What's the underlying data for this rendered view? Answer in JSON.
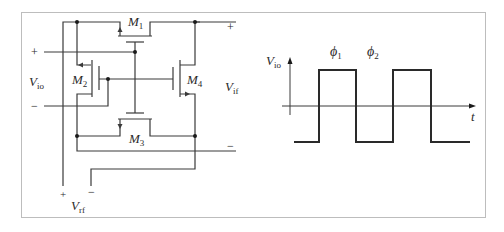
{
  "figure": {
    "frame_color": "#bdbdbd",
    "wire_color": "#3a3a3a",
    "circuit": {
      "transistors": [
        {
          "id": "M1",
          "label": "M",
          "sub": "1"
        },
        {
          "id": "M2",
          "label": "M",
          "sub": "2"
        },
        {
          "id": "M3",
          "label": "M",
          "sub": "3"
        },
        {
          "id": "M4",
          "label": "M",
          "sub": "4"
        }
      ],
      "ports": {
        "vio": {
          "label": "V",
          "sub": "io",
          "plus": "+",
          "minus": "−"
        },
        "vif": {
          "label": "V",
          "sub": "if",
          "plus": "+",
          "minus": "−"
        },
        "vrf": {
          "label": "V",
          "sub": "rf",
          "plus": "+",
          "minus": "−"
        }
      }
    },
    "waveform": {
      "y_axis_label": "V",
      "y_axis_sub": "io",
      "x_axis_label": "t",
      "phases": [
        {
          "label": "ϕ",
          "sub": "1"
        },
        {
          "label": "ϕ",
          "sub": "2"
        }
      ]
    }
  }
}
